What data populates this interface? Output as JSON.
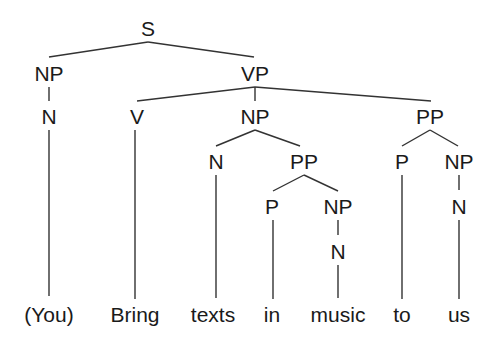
{
  "diagram": {
    "type": "syntax-tree",
    "nodes": {
      "s": {
        "label": "S",
        "x": 148,
        "y": 36
      },
      "np1": {
        "label": "NP",
        "x": 49,
        "y": 81
      },
      "vp": {
        "label": "VP",
        "x": 255,
        "y": 81
      },
      "n1": {
        "label": "N",
        "x": 49,
        "y": 124
      },
      "v": {
        "label": "V",
        "x": 137,
        "y": 124
      },
      "np2": {
        "label": "NP",
        "x": 255,
        "y": 124
      },
      "pp1": {
        "label": "PP",
        "x": 430,
        "y": 124
      },
      "n2": {
        "label": "N",
        "x": 216,
        "y": 169
      },
      "pp2": {
        "label": "PP",
        "x": 304,
        "y": 169
      },
      "p1": {
        "label": "P",
        "x": 402,
        "y": 169
      },
      "np3": {
        "label": "NP",
        "x": 459,
        "y": 169
      },
      "p2": {
        "label": "P",
        "x": 272,
        "y": 214
      },
      "np4": {
        "label": "NP",
        "x": 338,
        "y": 214
      },
      "n3": {
        "label": "N",
        "x": 459,
        "y": 214
      },
      "n4": {
        "label": "N",
        "x": 338,
        "y": 259
      }
    },
    "words": [
      {
        "label": "(You)",
        "x": 49
      },
      {
        "label": "Bring",
        "x": 135
      },
      {
        "label": "texts",
        "x": 213
      },
      {
        "label": "in",
        "x": 272
      },
      {
        "label": "music",
        "x": 338
      },
      {
        "label": "to",
        "x": 402
      },
      {
        "label": "us",
        "x": 459
      }
    ],
    "words_y": 322,
    "edges": [
      [
        148,
        42,
        49,
        57
      ],
      [
        148,
        42,
        254,
        57
      ],
      [
        49,
        87,
        49,
        101
      ],
      [
        255,
        87,
        137,
        101
      ],
      [
        255,
        87,
        255,
        101
      ],
      [
        255,
        87,
        431,
        101
      ],
      [
        255,
        130,
        216,
        146
      ],
      [
        255,
        130,
        300,
        146
      ],
      [
        430,
        130,
        402,
        146
      ],
      [
        430,
        130,
        458,
        146
      ],
      [
        304,
        175,
        273,
        191
      ],
      [
        304,
        175,
        338,
        191
      ],
      [
        459,
        175,
        459,
        190
      ],
      [
        338,
        220,
        338,
        235
      ],
      [
        49,
        130,
        49,
        296
      ],
      [
        135,
        130,
        135,
        299
      ],
      [
        216,
        175,
        216,
        298
      ],
      [
        273,
        220,
        273,
        299
      ],
      [
        338,
        265,
        338,
        298
      ],
      [
        402,
        175,
        402,
        299
      ],
      [
        459,
        220,
        459,
        299
      ]
    ]
  }
}
